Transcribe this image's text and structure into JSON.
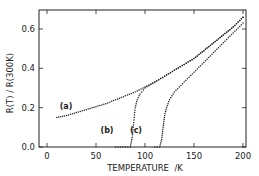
{
  "chart_data": {
    "type": "scatter",
    "title": "",
    "xlabel": "TEMPERATURE  /K",
    "ylabel": "R(T) / R(300K)",
    "xlim": [
      -8,
      202
    ],
    "ylim": [
      0,
      0.7
    ],
    "xticks": [
      0,
      50,
      100,
      150,
      200
    ],
    "xtick_labels": [
      "0",
      "50",
      "100",
      "150",
      "200"
    ],
    "yticks": [
      0.0,
      0.2,
      0.4,
      0.6
    ],
    "ytick_labels": [
      "0.0",
      "0.2",
      "0.4",
      "0.6"
    ],
    "grid": false,
    "legend": "none",
    "annotations": [
      {
        "text": "(a)",
        "x": 20,
        "y": 0.2
      },
      {
        "text": "(b)",
        "x": 75,
        "y": 0.12
      },
      {
        "text": "(c)",
        "x": 105,
        "y": 0.12
      }
    ],
    "series": [
      {
        "name": "(a)",
        "x": [
          10,
          20,
          30,
          40,
          50,
          60,
          70,
          80,
          90,
          100,
          110,
          120,
          130,
          140,
          150,
          160,
          170,
          180,
          190,
          200
        ],
        "values": [
          0.15,
          0.16,
          0.175,
          0.19,
          0.205,
          0.22,
          0.24,
          0.26,
          0.28,
          0.305,
          0.33,
          0.36,
          0.39,
          0.42,
          0.45,
          0.49,
          0.53,
          0.57,
          0.61,
          0.66
        ]
      },
      {
        "name": "(b)",
        "x": [
          70,
          80,
          85,
          87,
          88,
          89,
          90,
          92,
          95,
          100,
          110,
          120,
          130,
          140,
          150,
          160,
          170,
          180,
          190,
          200
        ],
        "values": [
          0.0,
          0.0,
          0.0,
          0.05,
          0.1,
          0.15,
          0.2,
          0.24,
          0.27,
          0.3,
          0.33,
          0.36,
          0.39,
          0.42,
          0.45,
          0.49,
          0.53,
          0.57,
          0.61,
          0.66
        ]
      },
      {
        "name": "(c)",
        "x": [
          110,
          115,
          117,
          118,
          119,
          120,
          122,
          125,
          130,
          140,
          150,
          160,
          170,
          180,
          190,
          200
        ],
        "values": [
          0.0,
          0.0,
          0.04,
          0.08,
          0.12,
          0.16,
          0.2,
          0.24,
          0.28,
          0.33,
          0.38,
          0.43,
          0.48,
          0.53,
          0.58,
          0.63
        ]
      }
    ]
  }
}
